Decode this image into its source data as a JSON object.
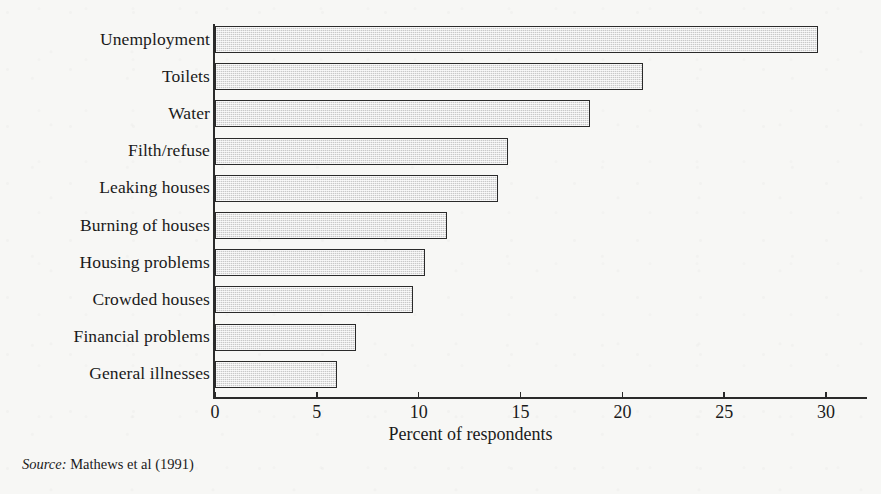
{
  "figure": {
    "background_color": "#f7f7f5",
    "ink_color": "#2a2a2a",
    "bar_fill_color": "#c9c9c9"
  },
  "source_note": {
    "label": "Source:",
    "text": "Mathews et al (1991)"
  },
  "chart_data": {
    "type": "bar",
    "orientation": "horizontal",
    "title": "",
    "xlabel": "Percent of respondents",
    "ylabel": "",
    "xlim": [
      0,
      32
    ],
    "xticks": [
      0,
      5,
      10,
      15,
      20,
      25,
      30
    ],
    "xtick_labels": [
      "0",
      "5",
      "10",
      "15",
      "20",
      "25",
      "30"
    ],
    "grid": false,
    "legend": null,
    "categories": [
      "Unemployment",
      "Toilets",
      "Water",
      "Filth/refuse",
      "Leaking houses",
      "Burning of houses",
      "Housing problems",
      "Crowded houses",
      "Financial problems",
      "General illnesses"
    ],
    "values": [
      29.6,
      21.0,
      18.4,
      14.4,
      13.9,
      11.4,
      10.3,
      9.7,
      6.9,
      6.0
    ]
  }
}
